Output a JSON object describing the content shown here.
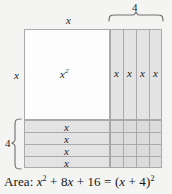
{
  "figure": {
    "caption": "Area: x² + 8x + 16 = (x + 4)²",
    "caption_parts": {
      "prefix": "Area:",
      "var1": "x",
      "exp1": "2",
      "plus1": "+",
      "coef": "8",
      "var2": "x",
      "plus2": "+",
      "const": "16",
      "equals": "=",
      "open": "(",
      "var3": "x",
      "plus3": "+",
      "four": "4",
      "close": ")",
      "exp2": "2"
    },
    "labels": {
      "top_side": "x",
      "left_side": "x",
      "big_square": "x²",
      "big_square_base": "x",
      "big_square_exp": "2",
      "top_brace": "4",
      "left_brace": "4"
    },
    "right_strips": [
      {
        "label": "x"
      },
      {
        "label": "x"
      },
      {
        "label": "x"
      },
      {
        "label": "x"
      }
    ],
    "bottom_rows": [
      {
        "label": "x"
      },
      {
        "label": "x"
      },
      {
        "label": "x"
      },
      {
        "label": "x"
      }
    ],
    "colors": {
      "background": "#f4f4f3",
      "square_fill": "#fdfdfd",
      "strip_fill": "#e3e3e3",
      "corner_fill": "#dcdcdc",
      "line": "#a9a9a9",
      "text": "#1b1b1b"
    }
  }
}
